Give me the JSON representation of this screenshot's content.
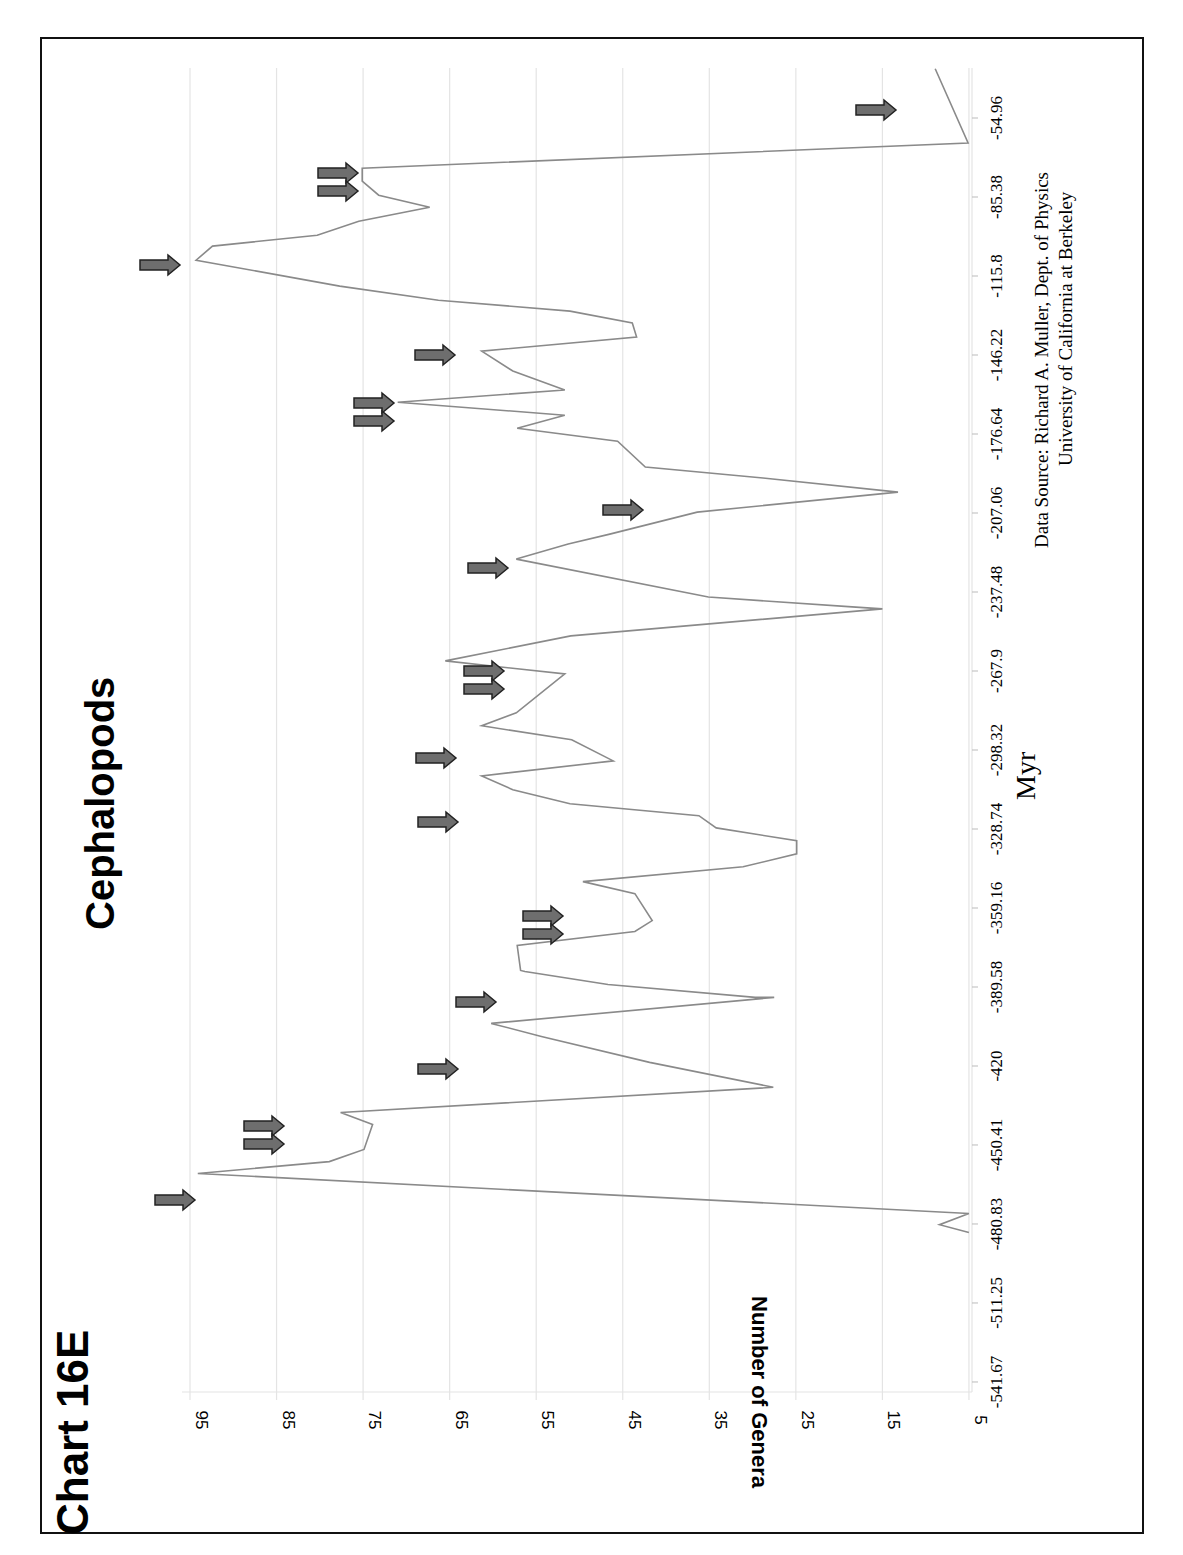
{
  "page": {
    "chart_label": "Chart 16E",
    "title": "Cephalopods",
    "y_axis_title": "Number of Genera",
    "x_axis_title": "Myr",
    "source_line1": "Data Source:  Richard A. Muller, Dept. of Physics",
    "source_line2": "University of California at Berkeley"
  },
  "colors": {
    "line": "#8a8a8a",
    "grid": "#e4e4e4",
    "arrow_fill": "#6e6e6e",
    "arrow_stroke": "#222222",
    "frame": "#111111",
    "text": "#000000"
  },
  "chart_data": {
    "type": "line",
    "title": "Cephalopods",
    "subtitle": "Chart 16E",
    "xlabel": "Myr",
    "ylabel": "Number of Genera",
    "orientation": "rotated 90° (page landscape); time runs top→bottom on screen, genera left(high)→right(low)",
    "x_ticks": [
      -541.67,
      -511.25,
      -480.83,
      -450.41,
      -420,
      -389.58,
      -359.16,
      -328.74,
      -298.32,
      -267.9,
      -237.48,
      -207.06,
      -176.64,
      -146.22,
      -115.8,
      -85.38,
      -54.96
    ],
    "y_ticks": [
      95,
      85,
      75,
      65,
      55,
      45,
      35,
      25,
      15,
      5
    ],
    "xlim": [
      -541.67,
      -35
    ],
    "ylim": [
      5,
      98
    ],
    "grid": true,
    "legend": null,
    "annotations": "Gray right-pointing arrows mark extinction events; double arrows mark paired events",
    "series": [
      {
        "name": "Cephalopod genera",
        "x": [
          -36,
          -64.6,
          -74.3,
          -79.3,
          -84.7,
          -89.3,
          -94.7,
          -100.1,
          -104.3,
          -109.7,
          -119.7,
          -125.1,
          -129.3,
          -133.9,
          -139.3,
          -144.7,
          -152.4,
          -159.7,
          -164.4,
          -169.4,
          -174.4,
          -179.4,
          -189.4,
          -193.6,
          -199.0,
          -206.7,
          -215.2,
          -219.0,
          -224.8,
          -239.4,
          -243.2,
          -244.0,
          -254.4,
          -264.0,
          -269.0,
          -284.0,
          -289.0,
          -294.4,
          -302.5,
          -308.3,
          -313.6,
          -319.0,
          -323.6,
          -328.3,
          -333.3,
          -338.3,
          -343.3,
          -349.0,
          -353.6,
          -364.0,
          -368.2,
          -373.6,
          -383.2,
          -383.6,
          -388.6,
          -393.6,
          -393.6,
          -403.6,
          -408.6,
          -418.6,
          -428.2,
          -437.9,
          -442.5,
          -452.1,
          -456.8,
          -461.4,
          -476.8,
          -481.1,
          -484.1
        ],
        "values": [
          8.9,
          5.1,
          75.1,
          75.1,
          73.2,
          67.3,
          75.5,
          80.3,
          92.4,
          94.3,
          77.7,
          66.3,
          51.1,
          43.9,
          43.4,
          61.3,
          57.7,
          51.7,
          71.0,
          51.7,
          57.2,
          45.6,
          42.4,
          28.8,
          13.2,
          36.4,
          46.5,
          51.3,
          57.3,
          35.1,
          18.5,
          15.0,
          51.0,
          65.5,
          51.7,
          57.3,
          61.3,
          50.9,
          46.1,
          61.3,
          57.7,
          51.1,
          36.2,
          34.2,
          24.9,
          24.9,
          31.1,
          49.6,
          43.6,
          41.6,
          43.6,
          57.2,
          56.8,
          56.3,
          46.7,
          29.7,
          27.5,
          60.2,
          54.4,
          41.9,
          27.6,
          77.6,
          73.9,
          74.9,
          78.9,
          94.1,
          5.0,
          8.4,
          5.0
        ]
      }
    ],
    "arrows": [
      {
        "y_screen": 110,
        "x_screen": 878,
        "count": 1
      },
      {
        "y_screen": 182,
        "x_screen": 340,
        "count": 2
      },
      {
        "y_screen": 265,
        "x_screen": 162,
        "count": 1
      },
      {
        "y_screen": 355,
        "x_screen": 437,
        "count": 1
      },
      {
        "y_screen": 412,
        "x_screen": 376,
        "count": 2
      },
      {
        "y_screen": 510,
        "x_screen": 625,
        "count": 1
      },
      {
        "y_screen": 568,
        "x_screen": 490,
        "count": 1
      },
      {
        "y_screen": 680,
        "x_screen": 486,
        "count": 2
      },
      {
        "y_screen": 758,
        "x_screen": 438,
        "count": 1
      },
      {
        "y_screen": 822,
        "x_screen": 440,
        "count": 1
      },
      {
        "y_screen": 925,
        "x_screen": 545,
        "count": 2
      },
      {
        "y_screen": 1002,
        "x_screen": 478,
        "count": 1
      },
      {
        "y_screen": 1069,
        "x_screen": 440,
        "count": 1
      },
      {
        "y_screen": 1135,
        "x_screen": 266,
        "count": 2
      },
      {
        "y_screen": 1200,
        "x_screen": 177,
        "count": 1
      }
    ]
  }
}
